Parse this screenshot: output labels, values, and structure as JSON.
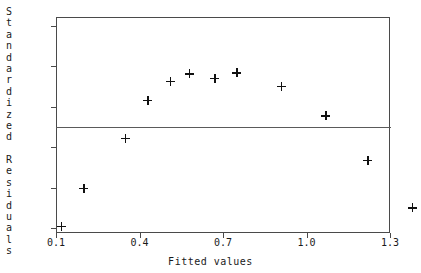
{
  "chart_data": {
    "type": "scatter",
    "title": "",
    "xlabel": "Fitted values",
    "ylabel": "Standardized Residuals",
    "xlim": [
      0.1,
      1.3
    ],
    "ylim": [
      -2.0,
      2.0
    ],
    "grid": false,
    "legend": null,
    "marker": "plus",
    "reference_line": {
      "orientation": "horizontal",
      "y": 0.0
    },
    "xticks": [
      "0.1",
      "0.4",
      "0.7",
      "1.0",
      "1.3"
    ],
    "xtick_values": [
      0.1,
      0.4,
      0.7,
      1.0,
      1.3
    ],
    "yticks": [
      "2.0",
      "1.2",
      "0.4",
      "-0.4",
      "-1.2",
      "-2.0"
    ],
    "ytick_values": [
      2.0,
      1.2,
      0.4,
      -0.4,
      -1.2,
      -2.0
    ],
    "x": [
      0.12,
      0.2,
      0.35,
      0.43,
      0.51,
      0.58,
      0.67,
      0.75,
      0.91,
      1.07,
      1.22,
      1.38
    ],
    "y": [
      -1.97,
      -1.21,
      -0.22,
      0.53,
      0.9,
      1.05,
      0.97,
      1.07,
      0.8,
      0.22,
      -0.66,
      -1.6
    ],
    "points": [
      {
        "x": 0.12,
        "y": -1.97
      },
      {
        "x": 0.2,
        "y": -1.21
      },
      {
        "x": 0.35,
        "y": -0.22
      },
      {
        "x": 0.43,
        "y": 0.53
      },
      {
        "x": 0.51,
        "y": 0.9
      },
      {
        "x": 0.58,
        "y": 1.05
      },
      {
        "x": 0.67,
        "y": 0.97
      },
      {
        "x": 0.75,
        "y": 1.07
      },
      {
        "x": 0.91,
        "y": 0.8
      },
      {
        "x": 1.07,
        "y": 0.22
      },
      {
        "x": 1.22,
        "y": -0.66
      },
      {
        "x": 1.38,
        "y": -1.6
      }
    ],
    "colors": {
      "marker": "#111111",
      "axis": "#4a4a4a",
      "reference_line": "#5a5a5a",
      "background": "#ffffff"
    }
  }
}
